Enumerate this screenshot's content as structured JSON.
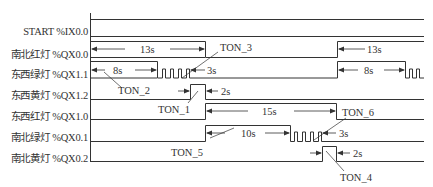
{
  "tracks": [
    {
      "id": "start",
      "label": "START %IX0.0"
    },
    {
      "id": "ns-red",
      "label": "南北红灯 %QX0.0"
    },
    {
      "id": "ew-green",
      "label": "东西绿灯 %QX1.1"
    },
    {
      "id": "ew-yellow",
      "label": "东西黄灯 %QX1.2"
    },
    {
      "id": "ew-red",
      "label": "东西红灯 %QX1.0"
    },
    {
      "id": "ns-green",
      "label": "南北绿灯 %QX0.1"
    },
    {
      "id": "ns-yellow",
      "label": "南北黄灯 %QX0.2"
    }
  ],
  "durations": {
    "ns_red": "13s",
    "ns_red_repeat": "13s",
    "ew_green": "8s",
    "ew_green_repeat": "8s",
    "ew_green_flash": "3s",
    "ew_yellow": "2s",
    "ew_red": "15s",
    "ns_green": "10s",
    "ns_green_flash": "3s",
    "ns_yellow": "2s"
  },
  "timers": {
    "ton1": "TON_1",
    "ton2": "TON_2",
    "ton3": "TON_3",
    "ton4": "TON_4",
    "ton5": "TON_5",
    "ton6": "TON_6"
  },
  "colors": {
    "line": "#333333",
    "text": "#333333"
  }
}
